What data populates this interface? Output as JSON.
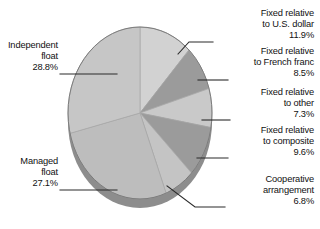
{
  "chart_data": {
    "type": "pie",
    "title": "",
    "subtitle": "",
    "xlabel": "",
    "ylabel": "",
    "legend_position": "callout-labels",
    "grid": false,
    "value_unit": "%",
    "start_angle_deg": 0,
    "direction": "clockwise",
    "three_d": true,
    "categories": [
      "Fixed relative to U.S. dollar",
      "Fixed relative to French franc",
      "Fixed relative to other",
      "Fixed relative to composite",
      "Cooperative arrangement",
      "Managed float",
      "Independent float"
    ],
    "values": [
      11.9,
      8.5,
      7.3,
      9.6,
      6.8,
      27.1,
      28.8
    ],
    "slices": [
      {
        "label_lines": [
          "Fixed relative",
          "to U.S. dollar"
        ],
        "percent_text": "11.9%",
        "value": 11.9,
        "color": "#d2d2d2"
      },
      {
        "label_lines": [
          "Fixed relative",
          "to French franc"
        ],
        "percent_text": "8.5%",
        "value": 8.5,
        "color": "#9b9b9b"
      },
      {
        "label_lines": [
          "Fixed relative",
          "to other"
        ],
        "percent_text": "7.3%",
        "value": 7.3,
        "color": "#c9c9c9"
      },
      {
        "label_lines": [
          "Fixed relative",
          "to composite"
        ],
        "percent_text": "9.6%",
        "value": 9.6,
        "color": "#9b9b9b"
      },
      {
        "label_lines": [
          "Cooperative",
          "arrangement"
        ],
        "percent_text": "6.8%",
        "value": 6.8,
        "color": "#c4c4c4"
      },
      {
        "label_lines": [
          "Managed",
          "float"
        ],
        "percent_text": "27.1%",
        "value": 27.1,
        "color": "#bdbdbd"
      },
      {
        "label_lines": [
          "Independent",
          "float"
        ],
        "percent_text": "28.8%",
        "value": 28.8,
        "color": "#c6c6c6"
      }
    ],
    "colors": {
      "background": "#ffffff",
      "rim_side": "#8d8d8d",
      "rim_edge": "#7a7a7a",
      "leader_line": "#2b2b2b",
      "text": "#111111"
    }
  },
  "labels": {
    "usd": {
      "line1": "Fixed relative",
      "line2": "to U.S. dollar",
      "percent": "11.9%"
    },
    "franc": {
      "line1": "Fixed relative",
      "line2": "to French franc",
      "percent": "8.5%"
    },
    "other": {
      "line1": "Fixed relative",
      "line2": "to other",
      "percent": "7.3%"
    },
    "composite": {
      "line1": "Fixed relative",
      "line2": "to composite",
      "percent": "9.6%"
    },
    "cooperative": {
      "line1": "Cooperative",
      "line2": "arrangement",
      "percent": "6.8%"
    },
    "managed": {
      "line1": "Managed",
      "line2": "float",
      "percent": "27.1%"
    },
    "independent": {
      "line1": "Independent",
      "line2": "float",
      "percent": "28.8%"
    }
  }
}
